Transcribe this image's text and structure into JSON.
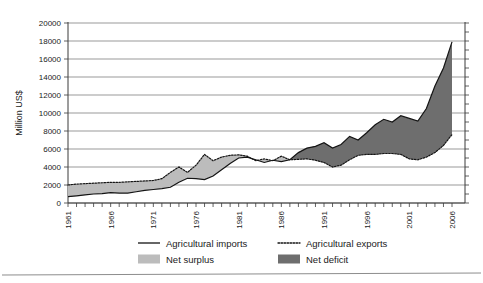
{
  "chart_data": {
    "type": "area",
    "title": "",
    "xlabel": "",
    "ylabel": "Million US$",
    "xlim": [
      1961,
      2006
    ],
    "ylim": [
      0,
      20000
    ],
    "grid": true,
    "legend_position": "bottom",
    "ytick_labels": [
      "0",
      "2000",
      "4000",
      "6000",
      "8000",
      "10000",
      "12000",
      "14000",
      "16000",
      "18000",
      "20000"
    ],
    "ytick_values": [
      0,
      2000,
      4000,
      6000,
      8000,
      10000,
      12000,
      14000,
      16000,
      18000,
      20000
    ],
    "xtick_labels": [
      "1961",
      "1966",
      "1971",
      "1976",
      "1981",
      "1986",
      "1991",
      "1996",
      "2001",
      "2006"
    ],
    "xtick_values": [
      1961,
      1966,
      1971,
      1976,
      1981,
      1986,
      1991,
      1996,
      2001,
      2006
    ],
    "x": [
      1961,
      1962,
      1963,
      1964,
      1965,
      1966,
      1967,
      1968,
      1969,
      1970,
      1971,
      1972,
      1973,
      1974,
      1975,
      1976,
      1977,
      1978,
      1979,
      1980,
      1981,
      1982,
      1983,
      1984,
      1985,
      1986,
      1987,
      1988,
      1989,
      1990,
      1991,
      1992,
      1993,
      1994,
      1995,
      1996,
      1997,
      1998,
      1999,
      2000,
      2001,
      2002,
      2003,
      2004,
      2005,
      2006
    ],
    "series": [
      {
        "name": "Agricultural imports",
        "style": "solid",
        "values": [
          700,
          800,
          900,
          1000,
          1050,
          1150,
          1100,
          1100,
          1250,
          1400,
          1500,
          1600,
          1750,
          2300,
          2750,
          2700,
          2600,
          3000,
          3700,
          4400,
          5000,
          5100,
          4800,
          4500,
          4750,
          4600,
          4800,
          5600,
          6100,
          6300,
          6700,
          6100,
          6500,
          7400,
          7000,
          7800,
          8700,
          9300,
          9000,
          9700,
          9400,
          9100,
          10500,
          13000,
          15000,
          17900
        ]
      },
      {
        "name": "Agricultural exports",
        "style": "dotted",
        "values": [
          2000,
          2100,
          2150,
          2200,
          2250,
          2300,
          2300,
          2350,
          2400,
          2450,
          2500,
          2700,
          3400,
          4000,
          3400,
          4200,
          5400,
          4700,
          5100,
          5300,
          5350,
          5200,
          4700,
          4900,
          4700,
          5200,
          4800,
          4850,
          4900,
          4750,
          4500,
          4000,
          4200,
          4800,
          5300,
          5400,
          5400,
          5500,
          5500,
          5400,
          4900,
          4800,
          5100,
          5600,
          6400,
          7600
        ]
      }
    ],
    "fills": [
      {
        "name": "Net surplus",
        "color": "#bcbcbc",
        "condition": "exports>imports"
      },
      {
        "name": "Net deficit",
        "color": "#6e6e6e",
        "condition": "imports>exports"
      }
    ]
  },
  "legend": {
    "items": [
      {
        "label": "Agricultural imports",
        "marker": "solid-line"
      },
      {
        "label": "Agricultural exports",
        "marker": "dotted-line"
      },
      {
        "label": "Net surplus",
        "marker": "light-swatch"
      },
      {
        "label": "Net deficit",
        "marker": "dark-swatch"
      }
    ]
  },
  "colors": {
    "surplus": "#bcbcbc",
    "deficit": "#6e6e6e",
    "line": "#141414",
    "grid": "#6f6f6f"
  }
}
